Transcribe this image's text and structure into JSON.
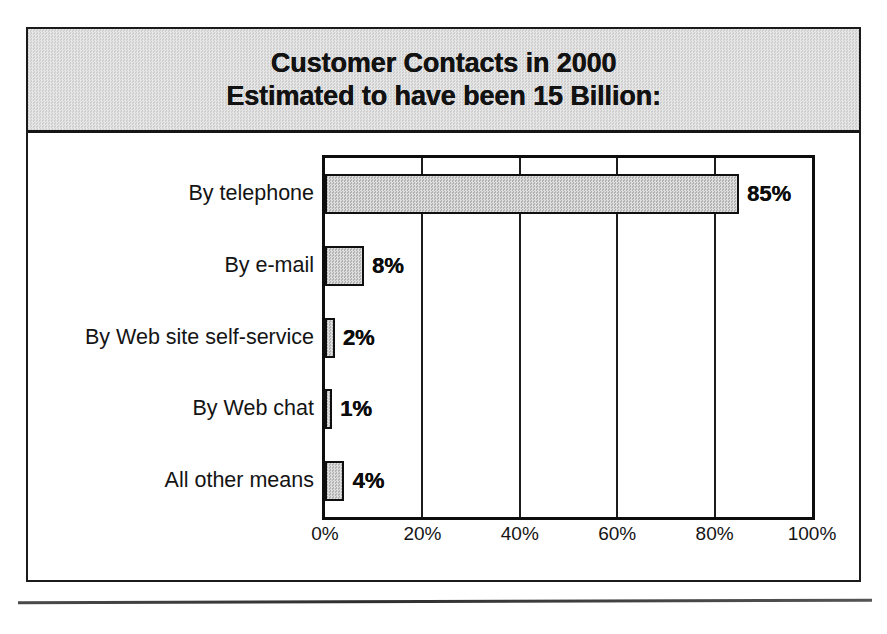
{
  "figure": {
    "title_line1": "Customer Contacts in 2000",
    "title_line2": "Estimated to have been 15 Billion:"
  },
  "chart_data": {
    "type": "bar",
    "orientation": "horizontal",
    "title": "Customer Contacts in 2000 Estimated to have been 15 Billion:",
    "categories": [
      "By telephone",
      "By e-mail",
      "By Web site self-service",
      "By Web chat",
      "All other means"
    ],
    "values": [
      85,
      8,
      2,
      1,
      4
    ],
    "data_labels": [
      "85%",
      "8%",
      "2%",
      "1%",
      "4%"
    ],
    "xlabel": "",
    "ylabel": "",
    "xlim": [
      0,
      100
    ],
    "xticks": [
      0,
      20,
      40,
      60,
      80,
      100
    ],
    "xtick_labels": [
      "0%",
      "20%",
      "40%",
      "60%",
      "80%",
      "100%"
    ],
    "grid": "vertical",
    "legend": "none",
    "bar_fill_color": "#c9c9c9",
    "bar_edge_color": "#0f0f0f",
    "title_band_color": "#d9d9d9"
  }
}
